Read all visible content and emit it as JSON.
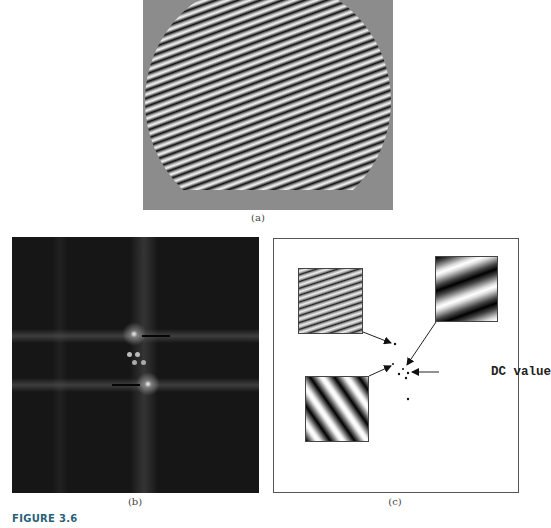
{
  "figure": {
    "label": "FIGURE 3.6",
    "label_color": "#2a5f7a"
  },
  "panels": {
    "a": {
      "caption": "(a)",
      "description": "circular disc of fine diagonal sinusoidal stripes on gray background",
      "background_color": "#8c8c8c"
    },
    "b": {
      "caption": "(b)",
      "description": "Fourier magnitude spectrum: dark background with one vertical band, two horizontal bands and bright peaks",
      "background_color": "#161616"
    },
    "c": {
      "caption": "(c)",
      "annotation": "DC value",
      "inset_patterns": [
        {
          "name": "fine-stripes",
          "position": "upper-left"
        },
        {
          "name": "wide-stripes",
          "position": "upper-right"
        },
        {
          "name": "diagonal-stripes",
          "position": "lower-left"
        }
      ]
    }
  }
}
